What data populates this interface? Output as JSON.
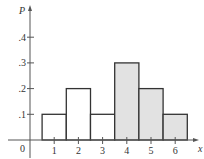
{
  "chart_data": {
    "type": "bar",
    "title": "",
    "xlabel": "x",
    "ylabel": "P",
    "categories": [
      "1",
      "2",
      "3",
      "4",
      "5",
      "6"
    ],
    "values": [
      0.1,
      0.2,
      0.1,
      0.3,
      0.2,
      0.1
    ],
    "shaded": [
      false,
      false,
      false,
      true,
      true,
      true
    ],
    "xlim": [
      0,
      6.5
    ],
    "ylim": [
      0,
      0.45
    ],
    "x_ticks": [
      "1",
      "2",
      "3",
      "4",
      "5",
      "6"
    ],
    "y_ticks": [
      ".1",
      ".2",
      ".3",
      ".4"
    ],
    "origin_label": "0",
    "grid": false,
    "legend": null,
    "colors": {
      "axis": "#555555",
      "bar_edge": "#333333",
      "bar_fill_plain": "#ffffff",
      "bar_fill_shaded": "#e2e2e2",
      "text": "#333333"
    }
  }
}
